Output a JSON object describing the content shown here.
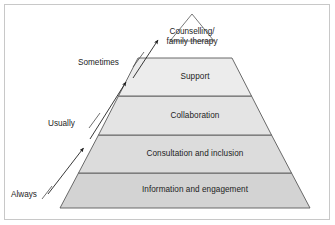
{
  "diagram": {
    "title_visible": false,
    "type": "pyramid",
    "background_color": "#ffffff",
    "border_color": "#c8c8c8",
    "text_color": "#1d1d1d",
    "outline_color": "#5a5a5a",
    "apex": {
      "line1": "Counselling/",
      "line2": "family therapy",
      "fill": "#ffffff"
    },
    "tiers": [
      {
        "label": "Support",
        "fill": "#ececec"
      },
      {
        "label": "Collaboration",
        "fill": "#e4e4e4"
      },
      {
        "label": "Consultation and inclusion",
        "fill": "#dcdcdc"
      },
      {
        "label": "Information and engagement",
        "fill": "#d3d3d3"
      }
    ],
    "frequency_labels": [
      {
        "label": "Sometimes"
      },
      {
        "label": "Usually"
      },
      {
        "label": "Always"
      }
    ]
  }
}
